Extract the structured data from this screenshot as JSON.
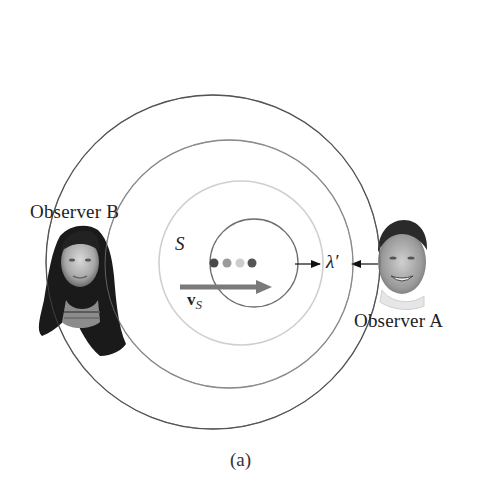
{
  "figure": {
    "caption": "(a)",
    "source_label": "S",
    "velocity_label": {
      "main": "v",
      "subscript": "S"
    },
    "wavelength_label": "λ′",
    "observers": [
      {
        "id": "A",
        "label": "Observer A",
        "side": "right"
      },
      {
        "id": "B",
        "label": "Observer B",
        "side": "left"
      }
    ],
    "wavefronts": [
      {
        "name": "outer",
        "cx": 213,
        "cy": 262,
        "r": 167,
        "color": "#555555"
      },
      {
        "name": "second",
        "cx": 229,
        "cy": 264,
        "r": 124,
        "color": "#8a8a8a"
      },
      {
        "name": "third",
        "cx": 241,
        "cy": 263,
        "r": 82,
        "color": "#cfcfcf"
      },
      {
        "name": "inner",
        "cx": 254,
        "cy": 263,
        "r": 44,
        "color": "#6e6e6e"
      }
    ],
    "source_positions": [
      {
        "x": 214,
        "y": 263,
        "color": "#4a4a4a"
      },
      {
        "x": 227,
        "y": 263,
        "color": "#9a9a9a"
      },
      {
        "x": 240,
        "y": 263,
        "color": "#cccccc"
      },
      {
        "x": 252,
        "y": 263,
        "color": "#555555"
      }
    ],
    "colors": {
      "velocity_arrow": "#777777",
      "text": "#222222"
    }
  }
}
